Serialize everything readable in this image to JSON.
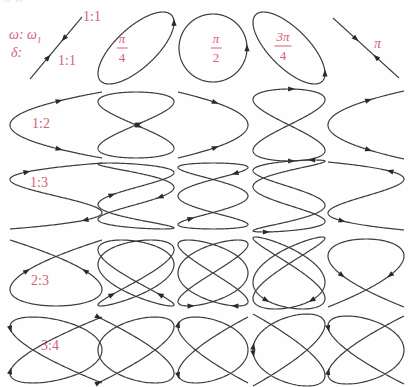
{
  "figure": {
    "top_partial_text": "ω: ω",
    "omega_axis_label": "ω: ω",
    "omega_axis_sub": "1",
    "delta_axis_label": "δ:",
    "header_ratio": "1:1",
    "accent_color": "#d4607a",
    "curve_color": "#3c3c3c"
  },
  "chart_data": {
    "type": "line",
    "subtype": "lissajous-grid",
    "equations": "x = cos(q·t), y = cos(p·t + δ), t ∈ [0, 2π]",
    "rows": [
      {
        "label": "1:1",
        "p": 1,
        "q": 1
      },
      {
        "label": "1:2",
        "p": 1,
        "q": 2
      },
      {
        "label": "1:3",
        "p": 1,
        "q": 3
      },
      {
        "label": "2:3",
        "p": 2,
        "q": 3
      },
      {
        "label": "3:4",
        "p": 3,
        "q": 4
      }
    ],
    "columns": [
      {
        "label": "",
        "delta": 0
      },
      {
        "label": "π/4",
        "numerator": "π",
        "denominator": "4",
        "delta": 0.7853981633974483
      },
      {
        "label": "π/2",
        "numerator": "π",
        "denominator": "2",
        "delta": 1.5707963267948966
      },
      {
        "label": "3π/4",
        "numerator": "3π",
        "denominator": "4",
        "delta": 2.356194490192345
      },
      {
        "label": "π",
        "delta": 3.141592653589793
      }
    ]
  }
}
